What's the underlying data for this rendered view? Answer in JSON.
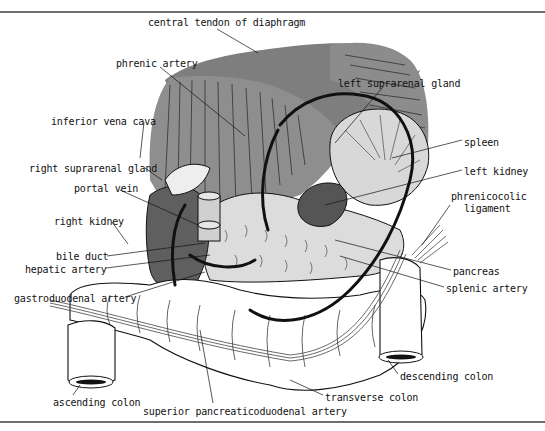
{
  "figure": {
    "colors": {
      "diaphragm_dark": "#7c7c7c",
      "diaphragm_mid": "#8e8e8e",
      "kidney": "#5e5e5e",
      "spleen": "#d6d6d6",
      "pancreas": "#dadada",
      "colon": "#ffffff",
      "outline": "#111111",
      "frame_rule": "#6e6e6e"
    }
  },
  "labels": [
    {
      "id": "central-tendon",
      "text": "central tendon of diaphragm",
      "x": 148,
      "y": 17
    },
    {
      "id": "phrenic-artery",
      "text": "phrenic artery",
      "x": 116,
      "y": 58
    },
    {
      "id": "left-suprarenal",
      "text": "left suprarenal gland",
      "x": 338,
      "y": 78
    },
    {
      "id": "inferior-vena-cava",
      "text": "inferior vena cava",
      "x": 51,
      "y": 116
    },
    {
      "id": "spleen",
      "text": "spleen",
      "x": 464,
      "y": 137
    },
    {
      "id": "right-suprarenal",
      "text": "right suprarenal gland",
      "x": 29,
      "y": 163
    },
    {
      "id": "left-kidney",
      "text": "left kidney",
      "x": 464,
      "y": 166
    },
    {
      "id": "portal-vein",
      "text": "portal vein",
      "x": 74,
      "y": 183
    },
    {
      "id": "phrenicocolic-1",
      "text": "phrenicocolic",
      "x": 451,
      "y": 191
    },
    {
      "id": "phrenicocolic-2",
      "text": "ligament",
      "x": 464,
      "y": 203
    },
    {
      "id": "right-kidney",
      "text": "right kidney",
      "x": 54,
      "y": 216
    },
    {
      "id": "bile-duct",
      "text": "bile duct",
      "x": 56,
      "y": 251
    },
    {
      "id": "hepatic-artery",
      "text": "hepatic artery",
      "x": 25,
      "y": 264
    },
    {
      "id": "pancreas",
      "text": "pancreas",
      "x": 453,
      "y": 266
    },
    {
      "id": "gastroduodenal",
      "text": "gastroduodenal artery",
      "x": 14,
      "y": 293
    },
    {
      "id": "splenic-artery",
      "text": "splenic artery",
      "x": 446,
      "y": 283
    },
    {
      "id": "descending-colon",
      "text": "descending colon",
      "x": 400,
      "y": 371
    },
    {
      "id": "transverse-colon",
      "text": "transverse colon",
      "x": 325,
      "y": 392
    },
    {
      "id": "ascending-colon",
      "text": "ascending colon",
      "x": 53,
      "y": 397
    },
    {
      "id": "superior-pancreaticoduodenal",
      "text": "superior pancreaticoduodenal artery",
      "x": 143,
      "y": 406
    }
  ]
}
